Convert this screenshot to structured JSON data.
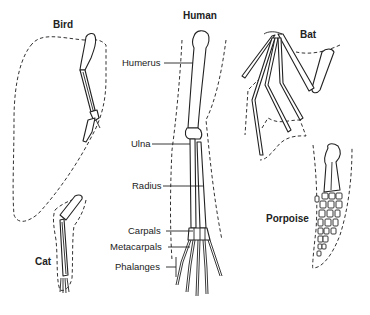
{
  "diagram": {
    "type": "homologous-structures",
    "animals": [
      {
        "id": "bird",
        "label": "Bird"
      },
      {
        "id": "human",
        "label": "Human"
      },
      {
        "id": "bat",
        "label": "Bat"
      },
      {
        "id": "cat",
        "label": "Cat"
      },
      {
        "id": "porpoise",
        "label": "Porpoise"
      }
    ],
    "bone_labels": [
      {
        "id": "humerus",
        "label": "Humerus"
      },
      {
        "id": "ulna",
        "label": "Ulna"
      },
      {
        "id": "radius",
        "label": "Radius"
      },
      {
        "id": "carpals",
        "label": "Carpals"
      },
      {
        "id": "metacarpals",
        "label": "Metacarpals"
      },
      {
        "id": "phalanges",
        "label": "Phalanges"
      }
    ],
    "colors": {
      "line": "#222222",
      "background": "#ffffff"
    }
  }
}
